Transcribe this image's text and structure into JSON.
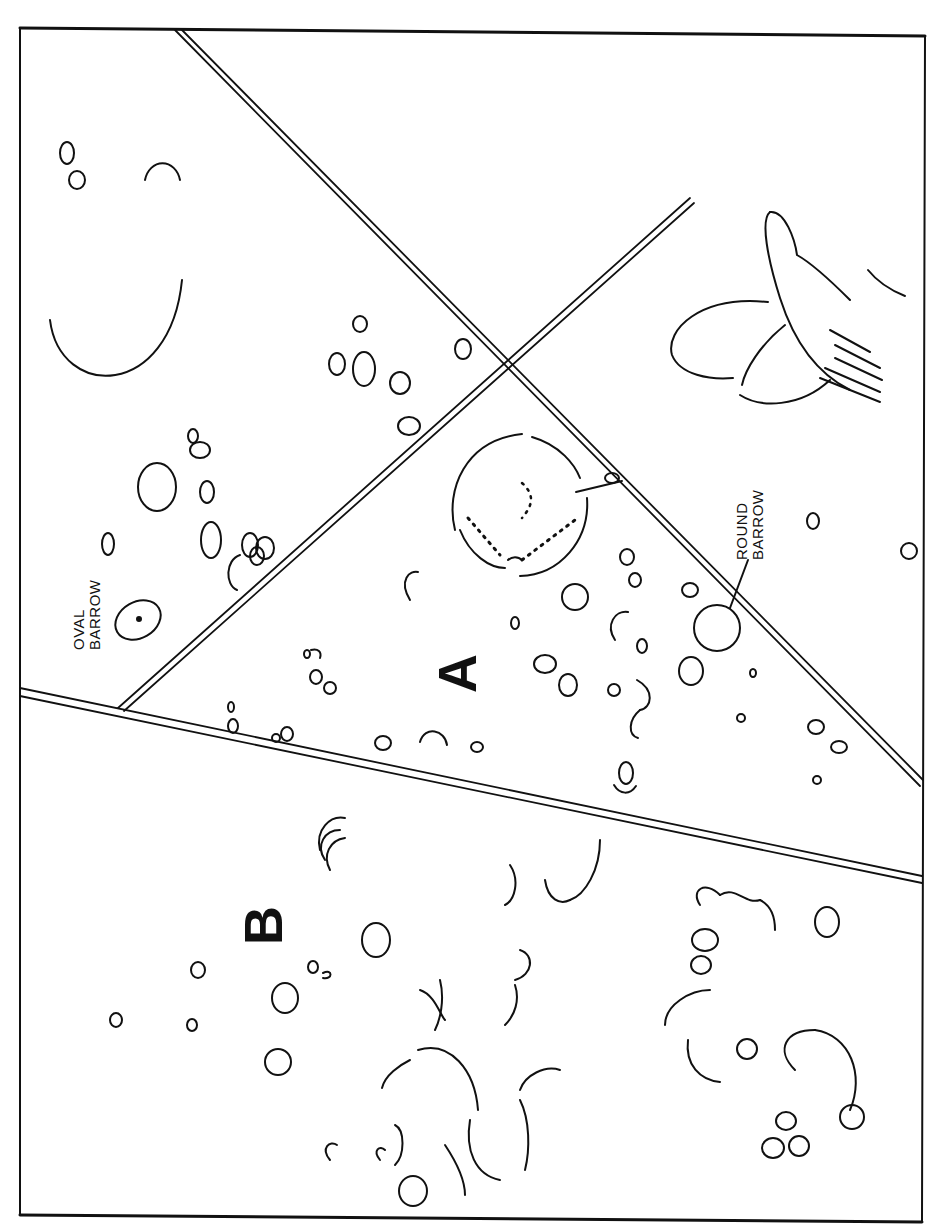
{
  "diagram": {
    "type": "archaeological cropmark plan",
    "orientation": "rotated 90 degrees counter-clockwise",
    "colors": {
      "line": "#111111",
      "background": "#ffffff"
    }
  },
  "labels": {
    "field_a": "A",
    "field_b": "B",
    "oval_barrow_line1": "OVAL",
    "oval_barrow_line2": "BARROW",
    "round_barrow_line1": "ROUND",
    "round_barrow_line2": "BARROW"
  },
  "features": [
    {
      "name": "oval-barrow",
      "kind": "ellipse with central dot"
    },
    {
      "name": "round-barrow",
      "kind": "circle with leader line"
    },
    {
      "name": "large-ring-ditch",
      "kind": "broken circle with dotted inner ring"
    },
    {
      "name": "field-boundaries",
      "kind": "double-line ditches"
    }
  ]
}
